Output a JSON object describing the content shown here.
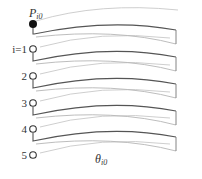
{
  "diagram": {
    "top_point": {
      "label_main": "P",
      "label_sub": "i0",
      "marker": "filled-circle",
      "color": "#111111"
    },
    "layers": [
      {
        "index_label": "i=1",
        "marker": "open-circle"
      },
      {
        "index_label": "2",
        "marker": "open-circle"
      },
      {
        "index_label": "3",
        "marker": "open-circle"
      },
      {
        "index_label": "4",
        "marker": "open-circle"
      },
      {
        "index_label": "5",
        "marker": "open-circle"
      }
    ],
    "angle_label": {
      "main": "θ",
      "sub": "i0"
    },
    "colors": {
      "strip_top_edge": "#555555",
      "strip_bottom_edge": "#b5b5b5",
      "guide_arc": "#c8c8c8",
      "marker_stroke": "#333333",
      "text": "#333333"
    }
  }
}
